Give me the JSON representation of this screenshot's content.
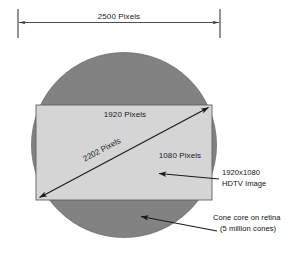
{
  "diagram": {
    "background_color": "#ffffff",
    "top_dimension": {
      "label": "2500 Pixels",
      "value": 2500,
      "unit": "Pixels",
      "left_tick_x": 18,
      "right_tick_x": 220,
      "line_y": 22,
      "color": "#333333"
    },
    "circle": {
      "name": "cone-core-retina",
      "fill": "#828282",
      "stroke": "#6f6f6f",
      "center_x": 124,
      "center_y": 145,
      "radius": 93,
      "diameter_pixels": 2500
    },
    "rectangle": {
      "name": "hdtv-image",
      "fill": "#d5d5d5",
      "stroke": "#6b6b6b",
      "left": 36,
      "top": 105,
      "right": 212,
      "bottom": 200,
      "width_pixels": 1920,
      "height_pixels": 1080
    },
    "labels": {
      "width_label": "1920 Pixels",
      "height_label": "1080 Pixels",
      "diagonal_label": "2202 Pixels"
    },
    "callouts": [
      {
        "id": "hdtv-callout",
        "line1": "1920x1080",
        "line2": "HDTV Image",
        "arrow_from_x": 220,
        "arrow_from_y": 178,
        "arrow_to_x": 157,
        "arrow_to_y": 174,
        "text_x": 222,
        "text_y": 176
      },
      {
        "id": "cone-callout",
        "line1": "Cone core on retina",
        "line2": "(5 million cones)",
        "arrow_from_x": 218,
        "arrow_from_y": 230,
        "arrow_to_x": 139,
        "arrow_to_y": 217,
        "text_x": 212,
        "text_y": 221
      }
    ],
    "colors": {
      "circle_gray": "#828282",
      "rect_gray": "#d5d5d5",
      "line_dark": "#1a1a1a",
      "text": "#111111"
    }
  }
}
